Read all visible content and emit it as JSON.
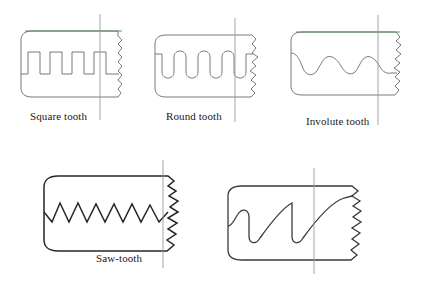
{
  "figure": {
    "background_color": "#ffffff",
    "outline_color": "#4a4a4a",
    "outline_color_dark": "#262626",
    "reference_line_color": "#5a9a5a",
    "center_line_color": "#9a9a9a",
    "label_color": "#1a1a1a"
  },
  "profiles": [
    {
      "id": "square-tooth",
      "label": "Square tooth",
      "tooth_shape": "rectangular",
      "tooth_count": 3,
      "row": 1,
      "column": 1,
      "has_reference_line": true,
      "has_center_line": true,
      "has_break_edge": true,
      "stroke_weight": "thin"
    },
    {
      "id": "round-tooth",
      "label": "Round tooth",
      "tooth_shape": "semicircular",
      "tooth_count": 3,
      "row": 1,
      "column": 2,
      "has_reference_line": false,
      "has_center_line": true,
      "has_break_edge": true,
      "stroke_weight": "thin"
    },
    {
      "id": "involute-tooth",
      "label": "Involute tooth",
      "tooth_shape": "involute-curve",
      "tooth_count": 3,
      "row": 1,
      "column": 3,
      "has_reference_line": true,
      "has_center_line": true,
      "has_break_edge": true,
      "stroke_weight": "thin"
    },
    {
      "id": "saw-tooth",
      "label": "Saw-tooth",
      "tooth_shape": "triangular-zigzag",
      "tooth_count": 6,
      "row": 2,
      "column": 1,
      "has_reference_line": false,
      "has_center_line": true,
      "has_break_edge": true,
      "stroke_weight": "thick"
    },
    {
      "id": "asymmetric-tooth",
      "label": "",
      "tooth_shape": "asymmetric-ramp",
      "tooth_count": 2,
      "row": 2,
      "column": 2,
      "has_reference_line": false,
      "has_center_line": true,
      "has_break_edge": true,
      "stroke_weight": "thick"
    }
  ]
}
